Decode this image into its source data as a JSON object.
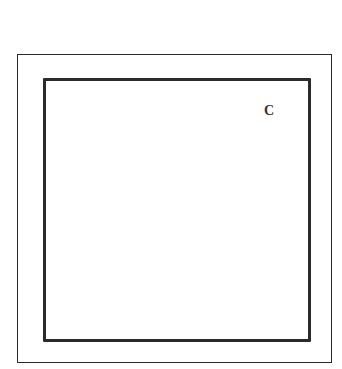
{
  "diagram": {
    "outer_frame": {
      "color": "#2a2a2a"
    },
    "inner_frame": {
      "color": "#2b2b2b"
    },
    "label": "C"
  }
}
